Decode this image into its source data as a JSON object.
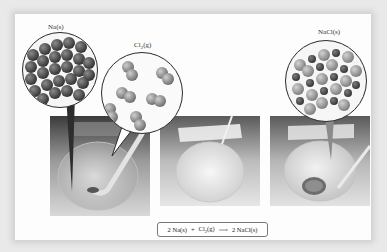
{
  "figure": {
    "labels": {
      "sodium": {
        "symbol": "Na",
        "state": "(s)"
      },
      "chlorine": {
        "symbol": "Cl",
        "subscript": "2",
        "state": "(g)"
      },
      "sodium_chloride": {
        "symbol": "NaCl",
        "state": "(s)"
      }
    },
    "equation": {
      "reactant1_coef": "2",
      "reactant1": "Na(s)",
      "plus": "+",
      "reactant2_symbol": "Cl",
      "reactant2_sub": "2",
      "reactant2_state": "(g)",
      "arrow": "⟶",
      "product_coef": "2",
      "product": "NaCl(s)"
    },
    "panels": [
      {
        "id": "before",
        "description": "Flask with Na metal and Cl2 gas inlet"
      },
      {
        "id": "reacting",
        "description": "Flask with white cloud during reaction"
      },
      {
        "id": "after",
        "description": "Flask containing NaCl solid"
      }
    ],
    "colors": {
      "background": "#e9e9e9",
      "card": "#fdfdfd",
      "na_atom": "#5a5a5a",
      "cl_atom": "#9a9a9a",
      "circle_border": "#2a2a2a"
    }
  }
}
